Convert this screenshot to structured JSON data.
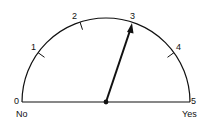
{
  "gauge": {
    "min": 0,
    "max": 5,
    "value": 3,
    "scale_labels": [
      "0",
      "1",
      "2",
      "3",
      "4",
      "5"
    ],
    "left_caption": "No",
    "right_caption": "Yes",
    "line_color": "#111111"
  }
}
